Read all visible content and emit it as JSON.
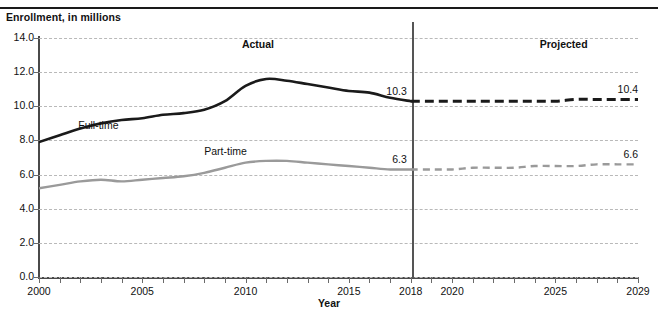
{
  "figure": {
    "title_cutoff": "states: Fall 2000 through 2029",
    "y_axis_caption": "Enrollment, in millions",
    "x_axis_title": "Year",
    "region_actual": "Actual",
    "region_projected": "Projected",
    "divider_year": 2018
  },
  "colors": {
    "fulltime": "#1a1a1a",
    "parttime": "#9a9a9a",
    "grid": "#b9b9b9",
    "axis": "#4a4a4a"
  },
  "chart_data": {
    "type": "line",
    "title": "states: Fall 2000 through 2029",
    "xlabel": "Year",
    "ylabel": "Enrollment, in millions",
    "xlim": [
      2000,
      2029
    ],
    "ylim": [
      0.0,
      14.0
    ],
    "ytick_labels": [
      "0.0",
      "2.0",
      "4.0",
      "6.0",
      "8.0",
      "10.0",
      "12.0",
      "14.0"
    ],
    "ytick_values": [
      0.0,
      2.0,
      4.0,
      6.0,
      8.0,
      10.0,
      12.0,
      14.0
    ],
    "xtick_labels": [
      "2000",
      "2005",
      "2010",
      "2015",
      "2018",
      "2020",
      "2025",
      "2029"
    ],
    "xtick_values": [
      2000,
      2005,
      2010,
      2015,
      2018,
      2020,
      2025,
      2029
    ],
    "grid": "horizontal-dashed",
    "legend": "inline-labels",
    "x": [
      2000,
      2001,
      2002,
      2003,
      2004,
      2005,
      2006,
      2007,
      2008,
      2009,
      2010,
      2011,
      2012,
      2013,
      2014,
      2015,
      2016,
      2017,
      2018,
      2019,
      2020,
      2021,
      2022,
      2023,
      2024,
      2025,
      2026,
      2027,
      2028,
      2029
    ],
    "series": [
      {
        "name": "Full-time",
        "label": "Full-time",
        "style_actual": "solid",
        "style_projected": "dashed",
        "color": "#1a1a1a",
        "values": [
          7.9,
          8.3,
          8.7,
          9.0,
          9.2,
          9.3,
          9.5,
          9.6,
          9.8,
          10.3,
          11.2,
          11.6,
          11.5,
          11.3,
          11.1,
          10.9,
          10.8,
          10.5,
          10.3,
          10.3,
          10.3,
          10.3,
          10.3,
          10.3,
          10.3,
          10.3,
          10.4,
          10.4,
          10.4,
          10.4
        ]
      },
      {
        "name": "Part-time",
        "label": "Part-time",
        "style_actual": "solid",
        "style_projected": "dashed",
        "color": "#9a9a9a",
        "values": [
          5.2,
          5.4,
          5.6,
          5.7,
          5.6,
          5.7,
          5.8,
          5.9,
          6.1,
          6.4,
          6.7,
          6.8,
          6.8,
          6.7,
          6.6,
          6.5,
          6.4,
          6.3,
          6.3,
          6.3,
          6.3,
          6.4,
          6.4,
          6.4,
          6.5,
          6.5,
          6.5,
          6.6,
          6.6,
          6.6
        ]
      }
    ],
    "annotations": [
      {
        "name": "fulltime-2018",
        "text": "10.3",
        "x": 2018,
        "y": 10.3
      },
      {
        "name": "fulltime-2029",
        "text": "10.4",
        "x": 2029,
        "y": 10.4
      },
      {
        "name": "parttime-2018",
        "text": "6.3",
        "x": 2018,
        "y": 6.3
      },
      {
        "name": "parttime-2029",
        "text": "6.6",
        "x": 2029,
        "y": 6.6
      }
    ]
  }
}
